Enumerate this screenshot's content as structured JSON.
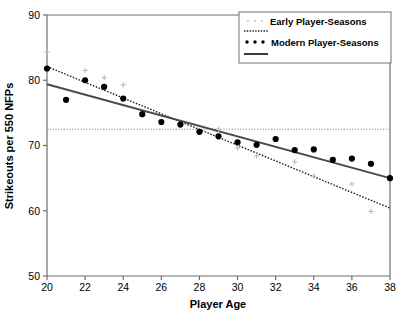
{
  "chart_data": {
    "type": "scatter",
    "title": "",
    "xlabel": "Player Age",
    "ylabel": "Strikeouts per 550 NFPs",
    "xlim": [
      20,
      38
    ],
    "ylim": [
      50,
      90
    ],
    "xticks": [
      20,
      22,
      24,
      26,
      28,
      30,
      32,
      34,
      36,
      38
    ],
    "yticks": [
      50,
      60,
      70,
      80,
      90
    ],
    "xtick_labels": [
      "20",
      "22",
      "24",
      "26",
      "28",
      "30",
      "32",
      "34",
      "36",
      "38"
    ],
    "ytick_labels": [
      "50",
      "60",
      "70",
      "80",
      "90"
    ],
    "grid": false,
    "legend_position": "top-right",
    "reference_line": {
      "orientation": "horizontal",
      "value": 72.5,
      "style": "dotted",
      "color": "#888888"
    },
    "series": [
      {
        "name": "Early Player-Seasons",
        "marker": "plus",
        "color": "#b9b9b9",
        "x": [
          20,
          22,
          23,
          24,
          25,
          27,
          29,
          30,
          31,
          33,
          34,
          36,
          37
        ],
        "values": [
          84.3,
          81.5,
          80.4,
          79.3,
          74.9,
          73.2,
          72.5,
          69.6,
          68.4,
          67.5,
          65.3,
          64.1,
          59.9
        ]
      },
      {
        "name": "Early Player-Seasons Trend",
        "marker": "none",
        "line": "dotted",
        "color": "#1a1a1a",
        "x": [
          20,
          38
        ],
        "values": [
          82.1,
          60.4
        ]
      },
      {
        "name": "Modern Player-Seasons",
        "marker": "circle",
        "color": "#000000",
        "x": [
          20,
          21,
          22,
          23,
          24,
          25,
          26,
          27,
          28,
          29,
          30,
          31,
          32,
          33,
          34,
          35,
          36,
          37,
          38
        ],
        "values": [
          81.8,
          77.0,
          80.0,
          79.0,
          77.2,
          74.8,
          73.6,
          73.2,
          72.1,
          71.4,
          70.5,
          70.1,
          71.0,
          69.3,
          69.4,
          67.8,
          68.0,
          67.2,
          65.0
        ]
      },
      {
        "name": "Modern Player-Seasons Trend",
        "marker": "none",
        "line": "solid",
        "color": "#4a4a4a",
        "x": [
          20,
          38
        ],
        "values": [
          79.4,
          65.0
        ]
      }
    ]
  },
  "axes": {
    "x_title": "Player  Age",
    "y_title": "Strikeouts  per  550  NFPs"
  },
  "legend": {
    "entries": [
      {
        "label": "Early Player-Seasons",
        "sample": "dots-gray"
      },
      {
        "label": "",
        "sample": "line-dotted"
      },
      {
        "label": "Modern Player-Seasons",
        "sample": "dots-black"
      },
      {
        "label": "",
        "sample": "line-solid"
      }
    ]
  },
  "colors": {
    "early_marker": "#b9b9b9",
    "early_line": "#1a1a1a",
    "modern_marker": "#000000",
    "modern_line": "#4a4a4a",
    "reference_line": "#999999",
    "axis": "#6e6e6e",
    "text": "#000000"
  }
}
